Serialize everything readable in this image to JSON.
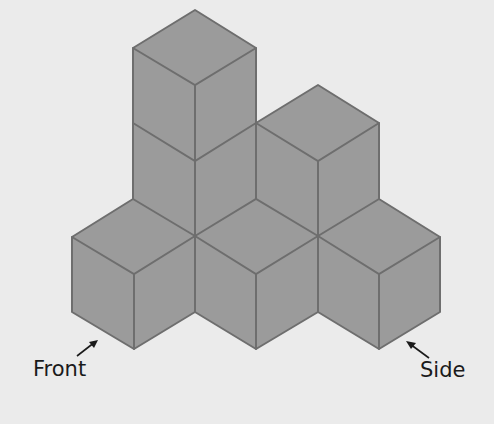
{
  "figure": {
    "colors": {
      "background": "#ebebeb",
      "cube_fill": "#9b9b9b",
      "edge": "#6e6e6e",
      "arrow": "#1a1a1a"
    },
    "labels": {
      "front": "Front",
      "side": "Side"
    },
    "cube_count": 8
  }
}
